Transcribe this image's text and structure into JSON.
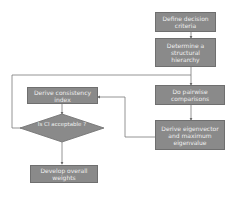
{
  "diagram": {
    "nodes": {
      "define_criteria": "Define decision criteria",
      "structural_hierarchy": "Determine a structural hierarchy",
      "pairwise": "Do pairwise comparisons",
      "eigenvector": "Derive eigenvector and maximum eigenvalue",
      "consistency_index": "Derive consistency index",
      "ci_acceptable": "Is CI acceptable ?",
      "overall_weights": "Develop overall weights"
    },
    "colors": {
      "box_fill": "#8a8a8a",
      "box_border": "#6f6f6f",
      "box_text": "#eeeeee",
      "line": "#7a7a7a"
    }
  }
}
